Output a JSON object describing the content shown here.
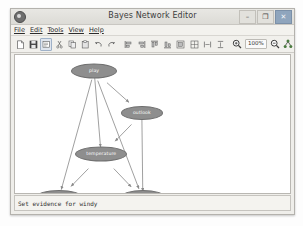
{
  "window": {
    "title": "Bayes Network Editor",
    "app_icon": "bayes-app-icon",
    "controls": [
      {
        "name": "minimize",
        "glyph": "–"
      },
      {
        "name": "maximize",
        "glyph": "❐"
      },
      {
        "name": "close",
        "glyph": "✕"
      }
    ]
  },
  "menubar": {
    "items": [
      {
        "label": "File",
        "mnemonic": "F"
      },
      {
        "label": "Edit",
        "mnemonic": "E"
      },
      {
        "label": "Tools",
        "mnemonic": "T"
      },
      {
        "label": "View",
        "mnemonic": "V"
      },
      {
        "label": "Help",
        "mnemonic": "H"
      }
    ]
  },
  "toolbar": {
    "zoom_level": "100%",
    "buttons": [
      {
        "name": "new-icon",
        "selected": false
      },
      {
        "name": "save-icon",
        "selected": false
      },
      {
        "name": "edit-mode-icon",
        "selected": true
      },
      {
        "name": "cut-icon",
        "selected": false
      },
      {
        "name": "copy-icon",
        "selected": false
      },
      {
        "name": "paste-icon",
        "selected": false
      },
      {
        "name": "undo-icon",
        "selected": false
      },
      {
        "name": "redo-icon",
        "selected": false
      },
      {
        "name": "align-left-icon",
        "selected": false
      },
      {
        "name": "align-right-icon",
        "selected": false
      },
      {
        "name": "align-top-icon",
        "selected": false
      },
      {
        "name": "align-bottom-icon",
        "selected": false
      },
      {
        "name": "center-horizontal-icon",
        "selected": false
      },
      {
        "name": "center-vertical-icon",
        "selected": false
      },
      {
        "name": "space-horizontal-icon",
        "selected": false
      },
      {
        "name": "space-vertical-icon",
        "selected": false
      },
      {
        "name": "zoom-in-icon",
        "selected": false
      },
      {
        "name": "zoom-out-icon",
        "selected": false
      },
      {
        "name": "layout-graph-icon",
        "selected": false
      }
    ]
  },
  "graph": {
    "nodes": [
      {
        "id": "play",
        "label": "play",
        "x": 78,
        "y": 16,
        "w": 44,
        "h": 13
      },
      {
        "id": "outlook",
        "label": "outlook",
        "x": 125,
        "y": 58,
        "w": 40,
        "h": 12
      },
      {
        "id": "temperature",
        "label": "temperature",
        "x": 85,
        "y": 99,
        "w": 50,
        "h": 13
      },
      {
        "id": "humidity",
        "label": "humidity",
        "x": 43,
        "y": 142,
        "w": 44,
        "h": 12
      },
      {
        "id": "windy",
        "label": "windy",
        "x": 126,
        "y": 142,
        "w": 42,
        "h": 12
      }
    ],
    "edges": [
      {
        "from": "play",
        "to": "outlook"
      },
      {
        "from": "play",
        "to": "temperature"
      },
      {
        "from": "play",
        "to": "humidity"
      },
      {
        "from": "play",
        "to": "windy"
      },
      {
        "from": "outlook",
        "to": "temperature"
      },
      {
        "from": "outlook",
        "to": "windy"
      },
      {
        "from": "temperature",
        "to": "humidity"
      },
      {
        "from": "temperature",
        "to": "windy"
      }
    ],
    "node_fill": "#8e8e8e",
    "node_stroke": "#6f6f6f",
    "edge_color": "#8a8a8a",
    "background": "#ffffff"
  },
  "statusbar": {
    "message": "Set evidence for windy"
  }
}
